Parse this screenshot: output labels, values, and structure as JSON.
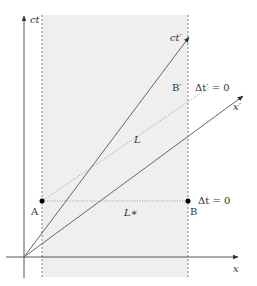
{
  "diagram": {
    "type": "spacetime-diagram",
    "colors": {
      "shaded_region": "#efefef",
      "axis": "#555555",
      "line": "#666666",
      "dotted": "#888888",
      "point": "#000000",
      "text": "#333333"
    },
    "axes": {
      "vertical_label": "ct",
      "horizontal_label": "x",
      "primed_time_label": "ct′",
      "primed_space_label": "x′"
    },
    "points": {
      "a_label": "A",
      "b_label": "B",
      "b_prime_label": "B′"
    },
    "lengths": {
      "proper_length_label": "L",
      "contracted_length_label": "L∗"
    },
    "simultaneity": {
      "unprimed_label": "Δt = 0",
      "primed_label": "Δt′ = 0"
    }
  }
}
